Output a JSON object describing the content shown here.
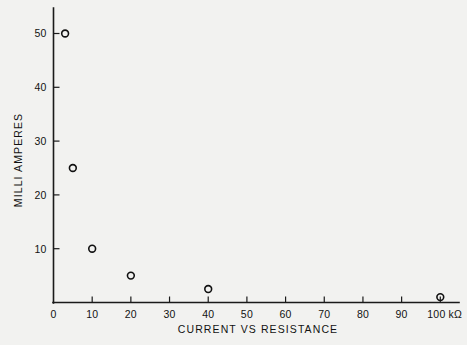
{
  "chart_data": {
    "type": "scatter",
    "title": "",
    "subtitle": "",
    "xlabel": "CURRENT VS RESISTANCE",
    "ylabel": "MILLI AMPERES",
    "x_unit": "kΩ",
    "xlim": [
      0,
      105
    ],
    "ylim": [
      0,
      55
    ],
    "grid": false,
    "legend": "none",
    "x_ticks": [
      {
        "value": 0,
        "label": "0"
      },
      {
        "value": 10,
        "label": "10"
      },
      {
        "value": 20,
        "label": "20"
      },
      {
        "value": 30,
        "label": "30"
      },
      {
        "value": 40,
        "label": "40"
      },
      {
        "value": 50,
        "label": "50"
      },
      {
        "value": 60,
        "label": "60"
      },
      {
        "value": 70,
        "label": "70"
      },
      {
        "value": 80,
        "label": "80"
      },
      {
        "value": 90,
        "label": "90"
      },
      {
        "value": 100,
        "label": "100 kΩ"
      }
    ],
    "y_ticks": [
      {
        "value": 10,
        "label": "10"
      },
      {
        "value": 20,
        "label": "20"
      },
      {
        "value": 30,
        "label": "30"
      },
      {
        "value": 40,
        "label": "40"
      },
      {
        "value": 50,
        "label": "50"
      }
    ],
    "series": [
      {
        "name": "current vs resistance",
        "marker": "open-circle",
        "color": "#111111",
        "points": [
          {
            "x": 3,
            "y": 50
          },
          {
            "x": 5,
            "y": 25
          },
          {
            "x": 10,
            "y": 10
          },
          {
            "x": 20,
            "y": 5
          },
          {
            "x": 40,
            "y": 2.5
          },
          {
            "x": 100,
            "y": 1
          }
        ]
      }
    ]
  },
  "figure": {
    "background_color": "#f2f2f0",
    "ink_color": "#111111"
  }
}
